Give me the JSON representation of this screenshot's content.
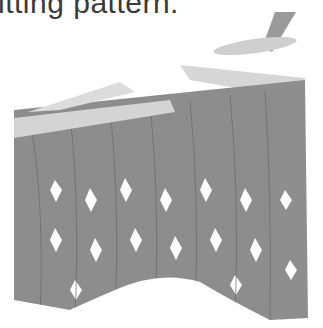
{
  "caption": {
    "text": "itting pattern."
  },
  "illustration": {
    "subject": "knitting stitches on needles",
    "colors": {
      "yarn": "#8c8c8c",
      "yarn_outline": "#6e6e6e",
      "needle": "#d2d2d2",
      "needle_dark": "#9a9a9a",
      "background": "#ffffff"
    }
  }
}
